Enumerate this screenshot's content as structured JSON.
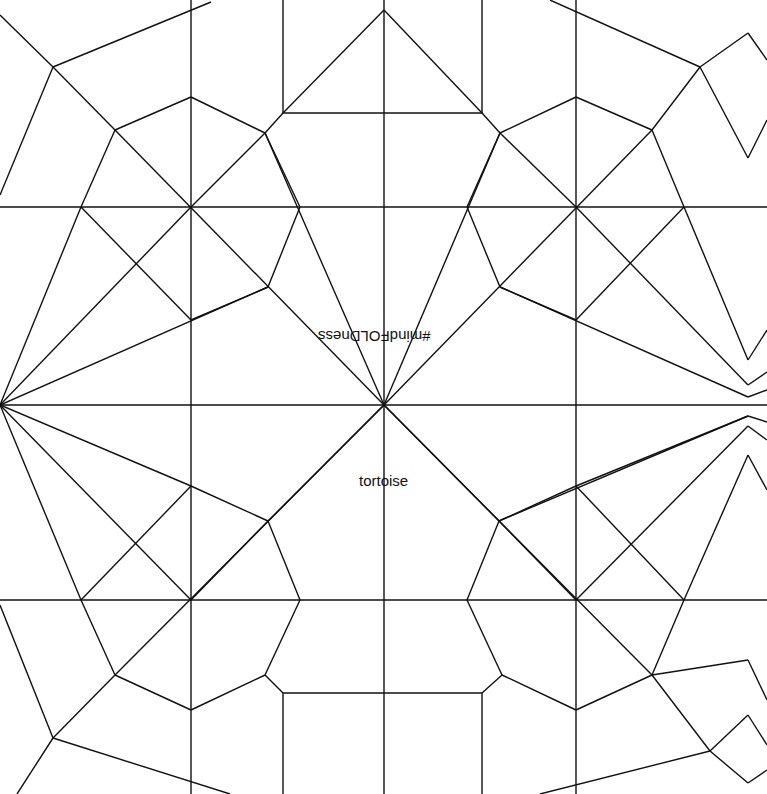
{
  "diagram": {
    "type": "origami crease pattern",
    "labels": {
      "upside_down": "#mindFOLDness",
      "model_name": "tortoise"
    },
    "line_color": "#111111",
    "background": "#ffffff",
    "segments": [
      [
        191,
        0,
        191,
        794
      ],
      [
        384,
        0,
        384,
        794
      ],
      [
        576,
        0,
        576,
        794
      ],
      [
        0,
        207,
        767,
        207
      ],
      [
        0,
        405,
        767,
        405
      ],
      [
        0,
        600,
        767,
        600
      ],
      [
        283,
        0,
        283,
        113
      ],
      [
        482,
        0,
        482,
        113
      ],
      [
        283,
        113,
        482,
        113
      ],
      [
        384,
        10,
        283,
        113
      ],
      [
        384,
        10,
        482,
        113
      ],
      [
        283,
        794,
        283,
        693
      ],
      [
        482,
        794,
        482,
        693
      ],
      [
        283,
        693,
        482,
        693
      ],
      [
        0,
        15,
        53,
        67
      ],
      [
        53,
        67,
        211,
        2
      ],
      [
        53,
        67,
        0,
        195
      ],
      [
        53,
        67,
        115,
        130
      ],
      [
        115,
        130,
        191,
        97
      ],
      [
        191,
        97,
        265,
        133
      ],
      [
        265,
        133,
        300,
        207
      ],
      [
        300,
        207,
        268,
        287
      ],
      [
        268,
        287,
        191,
        320
      ],
      [
        115,
        130,
        81,
        207
      ],
      [
        81,
        207,
        191,
        320
      ],
      [
        81,
        207,
        0,
        405
      ],
      [
        115,
        130,
        384,
        405
      ],
      [
        265,
        133,
        283,
        113
      ],
      [
        265,
        133,
        191,
        207
      ],
      [
        191,
        207,
        0,
        405
      ],
      [
        268,
        287,
        0,
        405
      ],
      [
        0,
        405,
        81,
        600
      ],
      [
        0,
        405,
        191,
        486
      ],
      [
        0,
        405,
        191,
        600
      ],
      [
        191,
        486,
        268,
        521
      ],
      [
        268,
        521,
        300,
        600
      ],
      [
        300,
        600,
        265,
        675
      ],
      [
        265,
        675,
        191,
        710
      ],
      [
        191,
        710,
        115,
        675
      ],
      [
        115,
        675,
        81,
        600
      ],
      [
        81,
        600,
        191,
        486
      ],
      [
        384,
        405,
        115,
        675
      ],
      [
        191,
        600,
        268,
        521
      ],
      [
        265,
        675,
        283,
        693
      ],
      [
        115,
        675,
        53,
        738
      ],
      [
        53,
        738,
        17,
        794
      ],
      [
        53,
        738,
        230,
        794
      ],
      [
        0,
        605,
        53,
        738
      ],
      [
        384,
        405,
        265,
        133
      ],
      [
        384,
        405,
        268,
        521
      ],
      [
        550,
        0,
        700,
        67
      ],
      [
        700,
        67,
        748,
        33
      ],
      [
        748,
        33,
        767,
        60
      ],
      [
        700,
        67,
        748,
        158
      ],
      [
        748,
        158,
        767,
        120
      ],
      [
        700,
        67,
        652,
        130
      ],
      [
        652,
        130,
        576,
        97
      ],
      [
        576,
        97,
        500,
        133
      ],
      [
        500,
        133,
        467,
        207
      ],
      [
        467,
        207,
        500,
        287
      ],
      [
        500,
        287,
        576,
        320
      ],
      [
        652,
        130,
        684,
        207
      ],
      [
        684,
        207,
        576,
        320
      ],
      [
        684,
        207,
        748,
        360
      ],
      [
        748,
        360,
        767,
        330
      ],
      [
        652,
        130,
        384,
        405
      ],
      [
        500,
        133,
        482,
        113
      ],
      [
        500,
        133,
        576,
        207
      ],
      [
        576,
        207,
        748,
        385
      ],
      [
        748,
        385,
        767,
        372
      ],
      [
        500,
        287,
        748,
        397
      ],
      [
        748,
        397,
        767,
        390
      ],
      [
        384,
        405,
        500,
        133
      ],
      [
        384,
        405,
        499,
        521
      ],
      [
        748,
        416,
        767,
        422
      ],
      [
        499,
        521,
        748,
        416
      ],
      [
        576,
        486,
        748,
        416
      ],
      [
        576,
        486,
        684,
        600
      ],
      [
        576,
        600,
        748,
        426
      ],
      [
        748,
        426,
        767,
        440
      ],
      [
        684,
        600,
        748,
        455
      ],
      [
        748,
        455,
        767,
        490
      ],
      [
        576,
        486,
        499,
        521
      ],
      [
        499,
        521,
        467,
        600
      ],
      [
        467,
        600,
        502,
        675
      ],
      [
        502,
        675,
        576,
        710
      ],
      [
        576,
        710,
        652,
        675
      ],
      [
        652,
        675,
        684,
        600
      ],
      [
        384,
        405,
        652,
        675
      ],
      [
        576,
        600,
        499,
        521
      ],
      [
        502,
        675,
        482,
        693
      ],
      [
        652,
        675,
        710,
        751
      ],
      [
        710,
        751,
        748,
        715
      ],
      [
        748,
        715,
        767,
        745
      ],
      [
        710,
        751,
        748,
        783
      ],
      [
        748,
        783,
        767,
        770
      ],
      [
        710,
        751,
        540,
        794
      ],
      [
        652,
        675,
        748,
        660
      ],
      [
        748,
        660,
        767,
        700
      ]
    ]
  }
}
